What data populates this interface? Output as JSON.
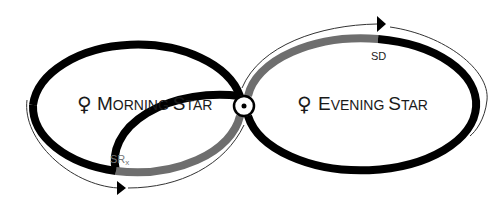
{
  "diagram": {
    "colors": {
      "direct": "#000000",
      "retrograde": "#6e6e6e",
      "arc": "#333333"
    },
    "left_loop": {
      "symbol": "♀",
      "label_first": "M",
      "label_rest": "ORNING ",
      "label_first2": "S",
      "label_rest2": "TAR"
    },
    "right_loop": {
      "symbol": "♀",
      "label_first": "E",
      "label_rest": "VENING ",
      "label_first2": "S",
      "label_rest2": "TAR"
    },
    "center_symbol": "sun-conjunction",
    "markers": {
      "station_retrograde": "SR",
      "station_retrograde_sub": "x",
      "station_direct": "SD"
    }
  }
}
